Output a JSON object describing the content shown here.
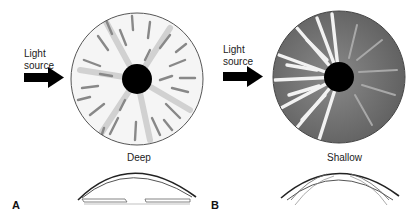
{
  "figure": {
    "panels": [
      {
        "letter": "A",
        "light_source_label_line1": "Light",
        "light_source_label_line2": "source",
        "depth_label": "Deep",
        "iris_style": "fully illuminated",
        "colors": {
          "iris_bg": "#f4f4f4",
          "stroma": "#8a8a8a",
          "pupil": "#000000"
        }
      },
      {
        "letter": "B",
        "light_source_label_line1": "Light",
        "light_source_label_line2": "source",
        "depth_label": "Shallow",
        "iris_style": "nasal half shadowed",
        "colors": {
          "iris_bg": "#7a7a7a",
          "stroma_lit": "#f2f2f2",
          "pupil": "#000000"
        }
      }
    ]
  }
}
